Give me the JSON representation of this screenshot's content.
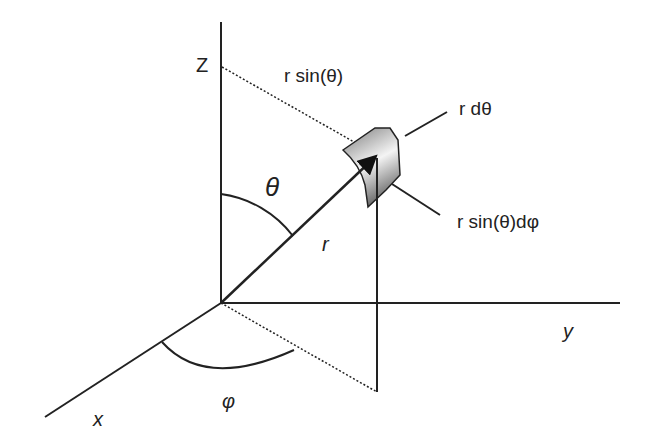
{
  "diagram": {
    "axes": {
      "z": "Z",
      "y": "y",
      "x": "x"
    },
    "labels": {
      "r_sin_theta": "r sin(θ)",
      "r_dtheta": "r dθ",
      "r_sin_theta_dphi": "r sin(θ)dφ",
      "theta": "θ",
      "phi": "φ",
      "r": "r"
    },
    "colors": {
      "line": "#222222",
      "patch_light": "#f2f2f2",
      "patch_dark": "#8a8a8a"
    }
  }
}
